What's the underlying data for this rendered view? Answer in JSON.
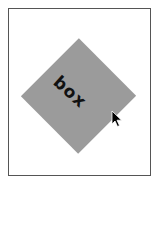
{
  "canvas": {
    "background": "#ffffff",
    "frame_border_color": "#555555"
  },
  "shape": {
    "type": "diamond",
    "fill": "#9b9b9b",
    "rotation_deg": 45,
    "label": "box"
  },
  "cursor": {
    "icon": "arrow-pointer-icon",
    "x": 112,
    "y": 111
  }
}
